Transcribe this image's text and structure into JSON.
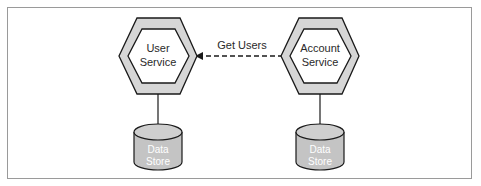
{
  "diagram": {
    "nodes": [
      {
        "id": "user-service",
        "type": "service-hexagon",
        "label_lines": [
          "User",
          "Service"
        ]
      },
      {
        "id": "account-service",
        "type": "service-hexagon",
        "label_lines": [
          "Account",
          "Service"
        ]
      },
      {
        "id": "user-data-store",
        "type": "database",
        "label_lines": [
          "Data",
          "Store"
        ]
      },
      {
        "id": "account-data-store",
        "type": "database",
        "label_lines": [
          "Data",
          "Store"
        ]
      }
    ],
    "edges": [
      {
        "from": "account-service",
        "to": "user-service",
        "style": "dashed",
        "arrow": "end",
        "label": "Get Users"
      },
      {
        "from": "user-service",
        "to": "user-data-store",
        "style": "solid",
        "arrow": "none"
      },
      {
        "from": "account-service",
        "to": "account-data-store",
        "style": "solid",
        "arrow": "none"
      }
    ],
    "colors": {
      "hex_outer_fill": "#d6d6d6",
      "hex_inner_fill": "#ffffff",
      "stroke": "#1a1a1a",
      "db_fill": "#c4c4c4",
      "frame": "#9a9a9a"
    }
  }
}
